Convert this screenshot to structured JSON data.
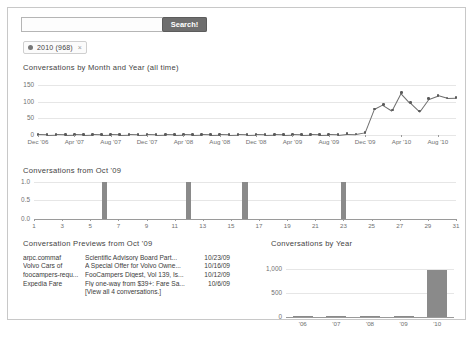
{
  "search": {
    "placeholder": "",
    "value": "",
    "button_label": "Search!"
  },
  "filter": {
    "label": "2010 (968)",
    "close_label": "×"
  },
  "sections": {
    "monthly_title": "Conversations by Month and Year (all time)",
    "october_title": "Conversations from Oct '09",
    "previews_title": "Conversation Previews from Oct '09",
    "year_title": "Conversations by Year"
  },
  "previews": {
    "rows": [
      {
        "sender": "arpc.commaf",
        "subject": "Scientific Advisory Board Part...",
        "date": "10/23/09"
      },
      {
        "sender": "Volvo Cars of",
        "subject": "A Special Offer for Volvo Owne...",
        "date": "10/16/09"
      },
      {
        "sender": "foocampers-requ...",
        "subject": "FooCampers Digest, Vol 139, Is...",
        "date": "10/12/09"
      },
      {
        "sender": "Expedia Fare",
        "subject": "Fly one-way from $39+: Fare Sa...",
        "date": "10/6/09"
      }
    ],
    "view_all": "[View all 4 conversations.]"
  },
  "colors": {
    "line": "#6d6d6d",
    "bar": "#8a8a8a",
    "grid": "#e6e6e6",
    "axis": "#9a9a9a",
    "button": "#6e6e6e"
  },
  "chart_data": [
    {
      "id": "monthly",
      "type": "line",
      "title": "Conversations by Month and Year (all time)",
      "xlabel": "",
      "ylabel": "",
      "ylim": [
        0,
        160
      ],
      "yticks": [
        0,
        50,
        100,
        150
      ],
      "ytick_labels": [
        "0",
        "50",
        "100",
        "150"
      ],
      "grid": true,
      "x": [
        "Dec '06",
        "Jan '07",
        "Feb '07",
        "Mar '07",
        "Apr '07",
        "May '07",
        "Jun '07",
        "Jul '07",
        "Aug '07",
        "Sep '07",
        "Oct '07",
        "Nov '07",
        "Dec '07",
        "Jan '08",
        "Feb '08",
        "Mar '08",
        "Apr '08",
        "May '08",
        "Jun '08",
        "Jul '08",
        "Aug '08",
        "Sep '08",
        "Oct '08",
        "Nov '08",
        "Dec '08",
        "Jan '09",
        "Feb '09",
        "Mar '09",
        "Apr '09",
        "May '09",
        "Jun '09",
        "Jul '09",
        "Aug '09",
        "Sep '09",
        "Oct '09",
        "Nov '09",
        "Dec '09",
        "Jan '10",
        "Feb '10",
        "Mar '10",
        "Apr '10",
        "May '10",
        "Jun '10",
        "Jul '10",
        "Aug '10",
        "Sep '10",
        "Oct '10"
      ],
      "xtick_labels": [
        "Dec '06",
        "Apr '07",
        "Aug '07",
        "Dec '07",
        "Apr '08",
        "Aug '08",
        "Dec '08",
        "Apr '09",
        "Aug '09",
        "Dec '09",
        "Apr '10",
        "Aug '10"
      ],
      "xtick_indices": [
        0,
        4,
        8,
        12,
        16,
        20,
        24,
        28,
        32,
        36,
        40,
        44
      ],
      "values": [
        2,
        1,
        2,
        1,
        2,
        1,
        2,
        1,
        2,
        1,
        2,
        1,
        2,
        1,
        2,
        1,
        2,
        1,
        2,
        1,
        2,
        1,
        2,
        1,
        2,
        1,
        2,
        1,
        2,
        1,
        2,
        1,
        2,
        1,
        4,
        3,
        8,
        78,
        92,
        75,
        128,
        98,
        72,
        110,
        120,
        112,
        113
      ]
    },
    {
      "id": "october",
      "type": "bar",
      "title": "Conversations from Oct '09",
      "xlabel": "",
      "ylabel": "",
      "ylim": [
        0,
        1.1
      ],
      "yticks": [
        0.0,
        0.5,
        1.0
      ],
      "ytick_labels": [
        "0.0",
        "0.5",
        "1.0"
      ],
      "grid": true,
      "categories": [
        1,
        2,
        3,
        4,
        5,
        6,
        7,
        8,
        9,
        10,
        11,
        12,
        13,
        14,
        15,
        16,
        17,
        18,
        19,
        20,
        21,
        22,
        23,
        24,
        25,
        26,
        27,
        28,
        29,
        30,
        31
      ],
      "xtick_labels": [
        "1",
        "3",
        "5",
        "7",
        "9",
        "11",
        "13",
        "15",
        "17",
        "19",
        "21",
        "23",
        "25",
        "27",
        "29",
        "31"
      ],
      "values": [
        0,
        0,
        0,
        0,
        0,
        1,
        0,
        0,
        0,
        0,
        0,
        1,
        0,
        0,
        0,
        1,
        0,
        0,
        0,
        0,
        0,
        0,
        1,
        0,
        0,
        0,
        0,
        0,
        0,
        0,
        0
      ]
    },
    {
      "id": "yearly",
      "type": "bar",
      "title": "Conversations by Year",
      "xlabel": "",
      "ylabel": "",
      "ylim": [
        0,
        1100
      ],
      "yticks": [
        0,
        500,
        1000
      ],
      "ytick_labels": [
        "0",
        "500",
        "1,000"
      ],
      "grid": true,
      "categories": [
        "'06",
        "'07",
        "'08",
        "'09",
        "'10"
      ],
      "values": [
        2,
        3,
        4,
        30,
        968
      ]
    }
  ]
}
